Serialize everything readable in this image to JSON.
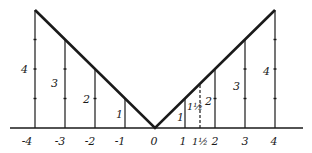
{
  "diagram": {
    "function": "y = |x|",
    "x_axis": {
      "tick_labels": [
        "-4",
        "-3",
        "-2",
        "-1",
        "0",
        "1",
        "1½",
        "2",
        "3",
        "4"
      ],
      "ticks": [
        -4,
        -3,
        -2,
        -1,
        0,
        1,
        1.5,
        2,
        3,
        4
      ]
    },
    "vertical_segments": [
      {
        "x": -4,
        "height": 4,
        "label": "4",
        "style": "solid"
      },
      {
        "x": -3,
        "height": 3,
        "label": "3",
        "style": "solid"
      },
      {
        "x": -2,
        "height": 2,
        "label": "2",
        "style": "solid"
      },
      {
        "x": -1,
        "height": 1,
        "label": "1",
        "style": "solid"
      },
      {
        "x": 1,
        "height": 1,
        "label": "1",
        "style": "solid"
      },
      {
        "x": 1.5,
        "height": 1.5,
        "label": "1½",
        "style": "dashed"
      },
      {
        "x": 2,
        "height": 2,
        "label": "2",
        "style": "solid"
      },
      {
        "x": 3,
        "height": 3,
        "label": "3",
        "style": "solid"
      },
      {
        "x": 4,
        "height": 4,
        "label": "4",
        "style": "solid"
      }
    ],
    "colors": {
      "line": "#1a1a1a",
      "background": "#ffffff"
    }
  }
}
